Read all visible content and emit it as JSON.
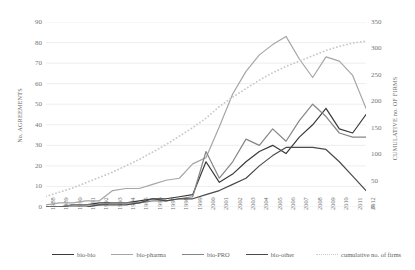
{
  "chart_data": {
    "type": "line",
    "title": "",
    "xlabel": "",
    "ylabel": "No. AGREEMENTS",
    "y2label": "CUMULATIVE no. OF FIRMS",
    "ylim": [
      0,
      90
    ],
    "y2lim": [
      0,
      350
    ],
    "yticks": [
      0,
      10,
      20,
      30,
      40,
      50,
      60,
      70,
      80,
      90
    ],
    "y2ticks": [
      0,
      50,
      100,
      150,
      200,
      250,
      300,
      350
    ],
    "grid": true,
    "legend_position": "bottom",
    "categories": [
      "1988",
      "1989",
      "1990",
      "1991",
      "1992",
      "1993",
      "1994",
      "1995",
      "1996",
      "1997",
      "1998",
      "1999",
      "2000",
      "2001",
      "2002",
      "2003",
      "2004",
      "2005",
      "2006",
      "2007",
      "2008",
      "2009",
      "2010",
      "2011",
      "2012"
    ],
    "series": [
      {
        "name": "bio-bio",
        "axis": "left",
        "color": "#3a3a3a",
        "style": "solid",
        "values": [
          0,
          0,
          1,
          1,
          2,
          2,
          2,
          3,
          4,
          4,
          5,
          6,
          22,
          12,
          16,
          22,
          27,
          30,
          26,
          34,
          40,
          48,
          38,
          36,
          45
        ]
      },
      {
        "name": "bio-pharma",
        "axis": "left",
        "color": "#a6a6a6",
        "style": "solid",
        "values": [
          1,
          2,
          2,
          3,
          3,
          8,
          9,
          9,
          11,
          13,
          14,
          21,
          24,
          39,
          55,
          66,
          74,
          79,
          83,
          72,
          63,
          73,
          71,
          64,
          48
        ]
      },
      {
        "name": "bio-PRO",
        "axis": "left",
        "color": "#858585",
        "style": "solid",
        "values": [
          0,
          0,
          1,
          1,
          1,
          2,
          2,
          2,
          3,
          3,
          4,
          5,
          27,
          14,
          22,
          33,
          30,
          38,
          32,
          42,
          50,
          44,
          36,
          34,
          34
        ]
      },
      {
        "name": "bio-other",
        "axis": "left",
        "color": "#4a4a4a",
        "style": "solid",
        "values": [
          0,
          0,
          0,
          0,
          1,
          1,
          1,
          2,
          4,
          3,
          4,
          4,
          6,
          8,
          11,
          14,
          20,
          25,
          29,
          29,
          29,
          28,
          22,
          15,
          8
        ]
      },
      {
        "name": "cumulative no. of firms",
        "axis": "right",
        "color": "#c9c9c9",
        "style": "dotted",
        "values": [
          20,
          28,
          36,
          46,
          56,
          66,
          78,
          90,
          104,
          118,
          134,
          150,
          168,
          190,
          208,
          224,
          240,
          254,
          266,
          276,
          286,
          296,
          304,
          310,
          314
        ]
      }
    ]
  },
  "legend": {
    "items": [
      {
        "label": "bio-bio",
        "color": "#3a3a3a",
        "style": "solid"
      },
      {
        "label": "bio-pharma",
        "color": "#a6a6a6",
        "style": "solid"
      },
      {
        "label": "bio-PRO",
        "color": "#858585",
        "style": "solid"
      },
      {
        "label": "bio-other",
        "color": "#4a4a4a",
        "style": "solid"
      },
      {
        "label": "cumulative no. of firms",
        "color": "#c9c9c9",
        "style": "dotted"
      }
    ]
  }
}
